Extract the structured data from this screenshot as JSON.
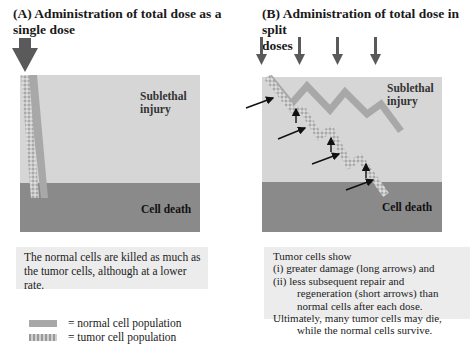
{
  "panel_a": {
    "title_line1": "(A) Administration of total dose as a",
    "title_line2": "single dose",
    "label_sublethal_1": "Sublethal",
    "label_sublethal_2": "injury",
    "label_death": "Cell death",
    "caption_lines": [
      "The normal cells are killed as much as",
      "the tumor cells, although at a lower",
      "rate."
    ]
  },
  "panel_b": {
    "title_line1": "(B) Administration of total dose in split",
    "title_line2": "doses",
    "label_sublethal_1": "Sublethal",
    "label_sublethal_2": "injury",
    "label_death": "Cell death",
    "dose_count": 4,
    "caption_lines": [
      "Tumor cells show",
      "(i) greater damage (long arrows) and",
      "(ii) less subsequent repair and",
      "regeneration (short arrows) than",
      "normal cells after each dose.",
      "Ultimately, many tumor cells may die,",
      "while the normal cells survive."
    ]
  },
  "legend": {
    "normal": "= normal cell population",
    "tumor": "= tumor cell population"
  },
  "colors": {
    "sublethal_zone": "#d6d6d6",
    "death_zone": "#8a8a8a",
    "normal_cells": "#a8a8a8",
    "tumor_cells": "#c4c4c4",
    "dose_arrow": "#5a5a5a",
    "caption_bg": "#ececec"
  }
}
